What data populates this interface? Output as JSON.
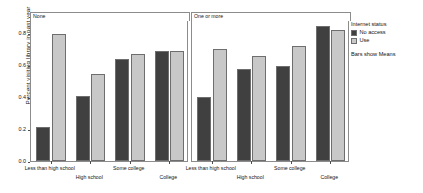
{
  "chart_data": {
    "type": "bar",
    "title": "",
    "xlabel": "",
    "ylabel": "Percent visiting library in past year",
    "ylim": [
      0,
      0.88
    ],
    "yticks": [
      0.0,
      0.2,
      0.4,
      0.6,
      0.8
    ],
    "ytick_labels": [
      "0.0",
      "0.2",
      "0.4",
      "0.6",
      "0.8"
    ],
    "grid": false,
    "legend_position": "right",
    "categories": [
      "Less than high school",
      "High school",
      "Some college",
      "College"
    ],
    "panels": [
      {
        "label": "None",
        "series": [
          {
            "name": "No access",
            "values": [
              0.215,
              0.405,
              0.635,
              0.685
            ]
          },
          {
            "name": "Use",
            "values": [
              0.79,
              0.545,
              0.665,
              0.685
            ]
          }
        ]
      },
      {
        "label": "One or more",
        "series": [
          {
            "name": "No access",
            "values": [
              0.4,
              0.575,
              0.595,
              0.845
            ]
          },
          {
            "name": "Use",
            "values": [
              0.7,
              0.655,
              0.715,
              0.815
            ]
          }
        ]
      }
    ],
    "legend": {
      "title": "Internet status",
      "entries": [
        {
          "label": "No access",
          "color": "#404040"
        },
        {
          "label": "Use",
          "color": "#c8c8c8"
        }
      ],
      "note": "Bars show Means"
    },
    "colors": {
      "no_access": "#404040",
      "use": "#c8c8c8",
      "axis": "#4d4d4d",
      "panel_border": "#8c8c8c",
      "background": "#ffffff"
    }
  }
}
